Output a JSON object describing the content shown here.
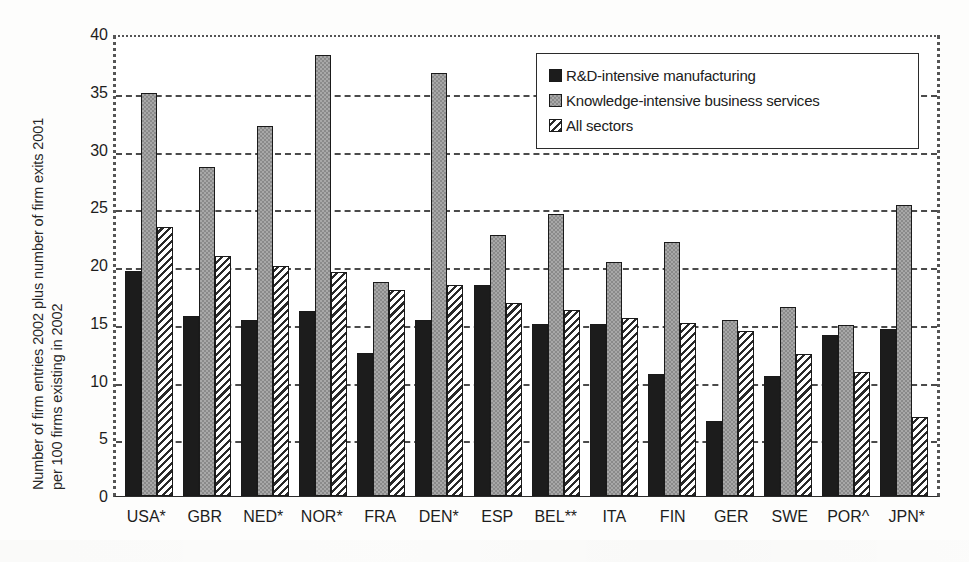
{
  "chart_data": {
    "type": "bar",
    "title": "",
    "subtitle": "",
    "xlabel": "",
    "ylabel": "Number of firm entries 2002 plus number of firm exits 2001 per 100 firms existing in 2002",
    "ylabel_lines": [
      "Number of firm entries 2002 plus number of firm exits 2001",
      "per 100 firms existing in 2002"
    ],
    "ylim": [
      0,
      40
    ],
    "ytick_step": 5,
    "yticks": [
      40,
      35,
      30,
      25,
      20,
      15,
      10,
      5,
      0
    ],
    "grid": true,
    "grid_axis": "y",
    "legend_position": "top-right",
    "categories": [
      "USA*",
      "GBR",
      "NED*",
      "NOR*",
      "FRA",
      "DEN*",
      "ESP",
      "BEL**",
      "ITA",
      "FIN",
      "GER",
      "SWE",
      "POR^",
      "JPN*"
    ],
    "series": [
      {
        "name": "R&D-intensive manufacturing",
        "pattern": "solid-black",
        "color": "#1c1c1c",
        "values": [
          19.5,
          15.6,
          15.2,
          16.0,
          12.4,
          15.2,
          18.3,
          14.9,
          14.9,
          10.6,
          6.5,
          10.4,
          13.9,
          14.5
        ]
      },
      {
        "name": "Knowledge-intensive business services",
        "pattern": "checkered-gray",
        "color": "#a8a8a8",
        "values": [
          34.9,
          28.5,
          32.0,
          38.2,
          18.5,
          36.6,
          22.6,
          24.4,
          20.3,
          22.0,
          15.2,
          16.4,
          14.8,
          25.2
        ]
      },
      {
        "name": "All sectors",
        "pattern": "diagonal-hatch",
        "color": "#ffffff",
        "values": [
          23.3,
          20.8,
          19.9,
          19.4,
          17.8,
          18.3,
          16.7,
          16.1,
          15.4,
          15.0,
          14.3,
          12.3,
          10.7,
          6.8
        ]
      }
    ]
  },
  "legend": {
    "entries": [
      {
        "label": "R&D-intensive manufacturing"
      },
      {
        "label": "Knowledge-intensive business services"
      },
      {
        "label": "All sectors"
      }
    ]
  }
}
